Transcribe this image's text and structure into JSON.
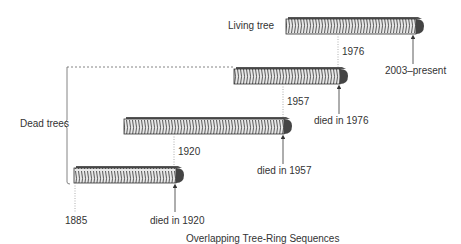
{
  "diagram": {
    "title": "Overlapping Tree-Ring Sequences",
    "group_label": "Dead trees",
    "trees": [
      {
        "label": "Living tree",
        "start_year": "1976",
        "end_label": "2003–present"
      },
      {
        "label": "Dead tree 1",
        "start_year": "1957",
        "end_label": "died in 1976"
      },
      {
        "label": "Dead tree 2",
        "start_year": "1920",
        "end_label": "died in 1957"
      },
      {
        "label": "Dead tree 3",
        "start_year": "1885",
        "end_label": "died in 1920"
      }
    ]
  }
}
